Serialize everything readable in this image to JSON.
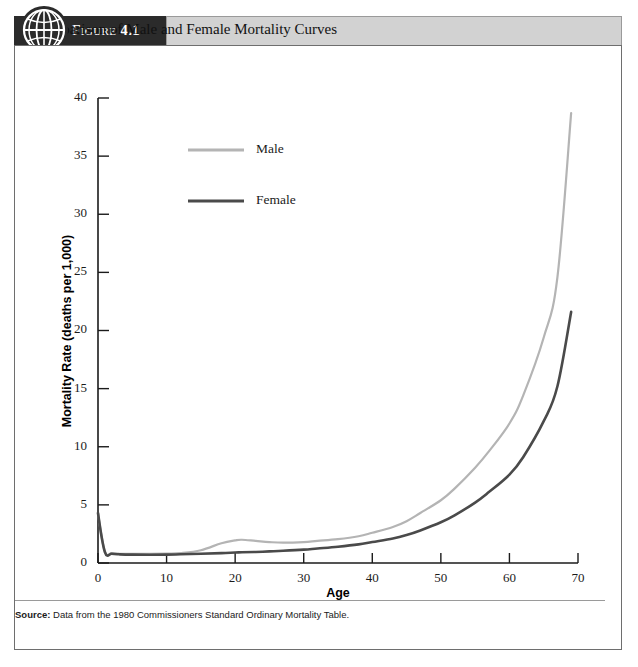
{
  "figure": {
    "tag_word": "Figure",
    "tag_number": "4.1",
    "title": "Comparison of Male and Female Mortality Curves",
    "icon": "globe-icon"
  },
  "source": {
    "label": "Source:",
    "text": " Data from the 1980 Commissioners Standard Ordinary Mortality Table."
  },
  "colors": {
    "male_line": "#b4b4b4",
    "female_line": "#4a4a4a",
    "axis": "#1b1b1b",
    "header_band": "#2b2b2b",
    "title_band": "#d2d2d2",
    "frame": "#6e6e6e"
  },
  "chart_data": {
    "type": "line",
    "title": "Comparison of Male and Female Mortality Curves",
    "xlabel": "Age",
    "ylabel": "Mortality Rate (deaths per 1,000)",
    "xlim": [
      0,
      70
    ],
    "ylim": [
      0,
      40
    ],
    "xticks": [
      0,
      10,
      20,
      30,
      40,
      50,
      60,
      70
    ],
    "yticks": [
      0,
      5,
      10,
      15,
      20,
      25,
      30,
      35,
      40
    ],
    "grid": false,
    "legend_position": "upper-left-inside",
    "x": [
      0,
      1,
      2,
      3,
      5,
      10,
      12,
      15,
      18,
      20,
      21,
      23,
      25,
      27,
      30,
      32,
      35,
      38,
      40,
      43,
      45,
      47,
      50,
      52,
      55,
      57,
      60,
      62,
      65,
      67,
      69
    ],
    "series": [
      {
        "name": "Male",
        "color": "#b4b4b4",
        "values": [
          4.3,
          1.0,
          0.85,
          0.8,
          0.78,
          0.8,
          0.85,
          1.1,
          1.7,
          1.95,
          2.0,
          1.9,
          1.8,
          1.75,
          1.8,
          1.9,
          2.05,
          2.3,
          2.6,
          3.1,
          3.6,
          4.3,
          5.4,
          6.4,
          8.2,
          9.6,
          12.0,
          14.4,
          19.4,
          24.6,
          38.7
        ]
      },
      {
        "name": "Female",
        "color": "#4a4a4a",
        "values": [
          4.3,
          0.95,
          0.8,
          0.75,
          0.72,
          0.72,
          0.75,
          0.8,
          0.85,
          0.9,
          0.92,
          0.95,
          1.0,
          1.05,
          1.15,
          1.25,
          1.4,
          1.6,
          1.8,
          2.1,
          2.4,
          2.8,
          3.5,
          4.1,
          5.2,
          6.1,
          7.6,
          9.1,
          12.2,
          15.2,
          21.6
        ]
      }
    ],
    "legend": [
      {
        "label": "Male",
        "color": "#b4b4b4"
      },
      {
        "label": "Female",
        "color": "#4a4a4a"
      }
    ]
  }
}
